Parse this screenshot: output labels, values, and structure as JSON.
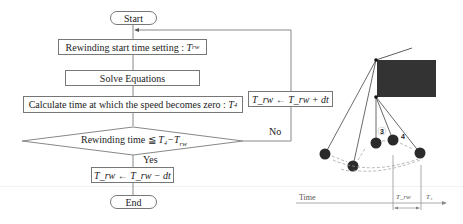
{
  "flowchart": {
    "start": "Start",
    "end": "End",
    "step_rewind_setting": {
      "text": "Rewinding start time setting : ",
      "var": "T",
      "sub": "rw"
    },
    "step_solve": "Solve Equations",
    "step_calc": {
      "text": "Calculate time at which the speed becomes zero : ",
      "var": "T",
      "sub": "4"
    },
    "decision": {
      "text": "Rewinding time ≦ ",
      "expr": "T₄−T",
      "sub": "rw"
    },
    "yes_label": "Yes",
    "no_label": "No",
    "step_decrement": "T_rw ← T_rw − dt",
    "step_increment": "T_rw ← T_rw + dt"
  },
  "pendulum": {
    "phase_labels": [
      "3",
      "4"
    ],
    "ball_color": "#2a2a2a",
    "block_color": "#333333"
  },
  "timeline": {
    "axis_label": "Time",
    "marker_trw": "T_rw",
    "marker_t4": "T₄"
  }
}
